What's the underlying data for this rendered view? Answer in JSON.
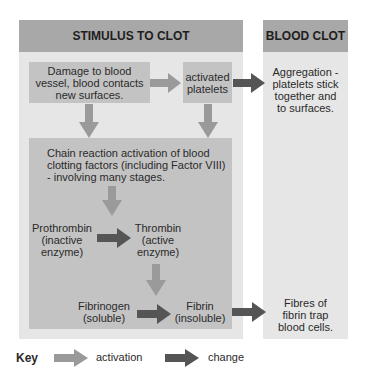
{
  "left_panel": {
    "header": "STIMULUS TO CLOT",
    "damage_box": "Damage to blood\nvessel, blood contacts\nnew surfaces.",
    "platelets_box": "activated\nplatelets",
    "chain_box": "Chain reaction activation of blood\nclotting factors (including Factor VIII)\n- involving many stages.",
    "prothrombin": "Prothrombin\n(inactive\nenzyme)",
    "thrombin": "Thrombin\n(active\nenzyme)",
    "fibrinogen": "Fibrinogen\n(soluble)",
    "fibrin": "Fibrin\n(insoluble)"
  },
  "right_panel": {
    "header": "BLOOD CLOT",
    "aggregation": "Aggregation -\nplatelets stick\ntogether and\nto surfaces.",
    "fibres": "Fibres of\nfibrin trap\nblood cells."
  },
  "key": {
    "label": "Key",
    "activation": "activation",
    "change": "change"
  },
  "colors": {
    "header": "#a8a8a8",
    "panel": "#e6e6e6",
    "box": "#c3c3c3",
    "activation_arrow": "#9a9a9a",
    "change_arrow": "#555555"
  }
}
